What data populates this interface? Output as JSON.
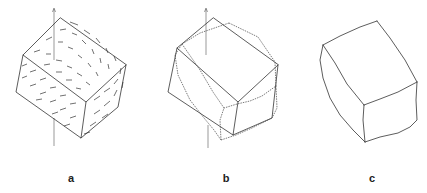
{
  "figure": {
    "panels": [
      {
        "id": "a",
        "label": "a",
        "description": "rigid cube wireframe with displacement vector field"
      },
      {
        "id": "b",
        "label": "b",
        "description": "rigid cube overlaid with deformed cube"
      },
      {
        "id": "c",
        "label": "c",
        "description": "deformed cube outline"
      }
    ]
  }
}
